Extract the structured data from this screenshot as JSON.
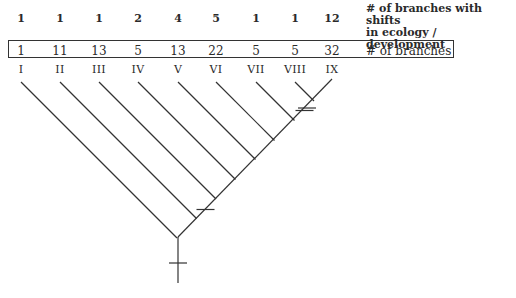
{
  "shift_legend": [
    "# of branches with shifts",
    "in ecology / development"
  ],
  "branches_legend": "# of branches",
  "clades": [
    {
      "label": "I",
      "branches": "1",
      "shifts": "1"
    },
    {
      "label": "II",
      "branches": "11",
      "shifts": "1"
    },
    {
      "label": "III",
      "branches": "13",
      "shifts": "1"
    },
    {
      "label": "IV",
      "branches": "5",
      "shifts": "2"
    },
    {
      "label": "V",
      "branches": "13",
      "shifts": "4"
    },
    {
      "label": "VI",
      "branches": "22",
      "shifts": "5"
    },
    {
      "label": "VII",
      "branches": "5",
      "shifts": "1"
    },
    {
      "label": "VIII",
      "branches": "5",
      "shifts": "1"
    },
    {
      "label": "IX",
      "branches": "32",
      "shifts": "12"
    }
  ],
  "tree": {
    "type": "ladderized cladogram",
    "marked_transitions": [
      "root stem",
      "node joining II with III–IX",
      "node joining VII with VIII–IX",
      "node joining VIII with IX"
    ],
    "line_color": "#333333"
  }
}
